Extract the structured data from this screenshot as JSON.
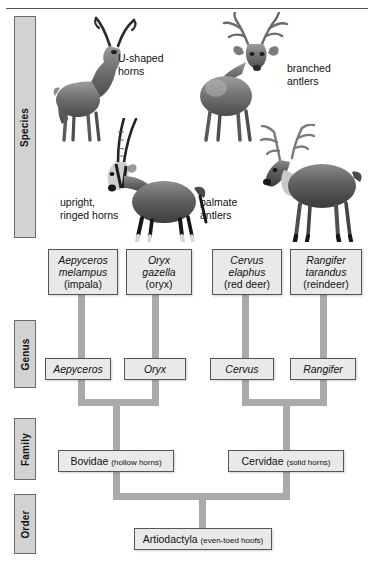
{
  "figure": {
    "ranks": [
      {
        "id": "species",
        "label": "Species"
      },
      {
        "id": "genus",
        "label": "Genus"
      },
      {
        "id": "family",
        "label": "Family"
      },
      {
        "id": "order",
        "label": "Order"
      }
    ],
    "species": [
      {
        "sci_line1": "Aepyceros",
        "sci_line2": "melampus",
        "common": "(impala)"
      },
      {
        "sci_line1": "Oryx",
        "sci_line2": "gazella",
        "common": "(oryx)"
      },
      {
        "sci_line1": "Cervus",
        "sci_line2": "elaphus",
        "common": "(red deer)"
      },
      {
        "sci_line1": "Rangifer",
        "sci_line2": "tarandus",
        "common": "(reindeer)"
      }
    ],
    "genera": [
      {
        "name": "Aepyceros"
      },
      {
        "name": "Oryx"
      },
      {
        "name": "Cervus"
      },
      {
        "name": "Rangifer"
      }
    ],
    "families": [
      {
        "name": "Bovidae",
        "note": "(hollow horns)"
      },
      {
        "name": "Cervidae",
        "note": "(solid horns)"
      }
    ],
    "order": {
      "name": "Artiodactyla",
      "note": "(even-toed hoofs)"
    },
    "annotations": [
      {
        "id": "u-shaped-horns",
        "text": "U-shaped\nhorns"
      },
      {
        "id": "branched-antlers",
        "text": "branched\nantlers"
      },
      {
        "id": "upright-ringed-horns",
        "text": "upright,\nringed horns"
      },
      {
        "id": "palmate-antlers",
        "text": "palmate\nantlers"
      }
    ],
    "illustrations": [
      {
        "id": "impala",
        "caption": "impala"
      },
      {
        "id": "red-deer",
        "caption": "red deer"
      },
      {
        "id": "oryx",
        "caption": "oryx"
      },
      {
        "id": "reindeer",
        "caption": "reindeer"
      }
    ],
    "colors": {
      "connector": "#aaaaaa",
      "box_fill": "#e9e9e9",
      "box_border": "#555555",
      "rank_fill": "#d2d2d2",
      "rank_border": "#6b6b6b",
      "text": "#111111"
    }
  }
}
